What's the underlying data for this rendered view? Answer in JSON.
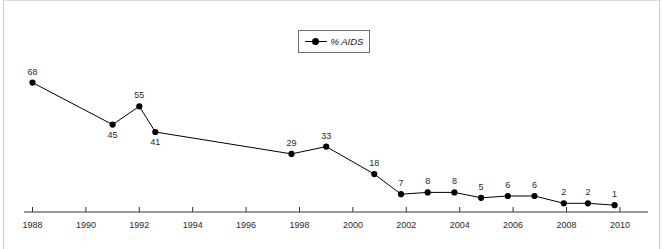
{
  "chart_data": {
    "type": "line",
    "title": "",
    "subtitle": "",
    "xlabel": "",
    "ylabel": "",
    "grid": false,
    "legend_position": "top-center",
    "legend": [
      "% AIDS"
    ],
    "series": [
      {
        "name": "% AIDS",
        "marker": "filled-circle",
        "color": "#000000",
        "x": [
          1988,
          1991,
          1992,
          1992.6,
          1997.7,
          1999,
          2000.8,
          2001.8,
          2002.8,
          2003.8,
          2004.8,
          2005.8,
          2006.8,
          2007.9,
          2008.8,
          2009.8
        ],
        "values": [
          68,
          45,
          55,
          41,
          29,
          33,
          18,
          7,
          8,
          8,
          5,
          6,
          6,
          2,
          2,
          1
        ]
      }
    ],
    "point_labels": [
      "68",
      "45",
      "55",
      "41",
      "29",
      "33",
      "18",
      "7",
      "8",
      "8",
      "5",
      "6",
      "6",
      "2",
      "2",
      "1"
    ],
    "xticks": [
      1988,
      1990,
      1992,
      1994,
      1996,
      1998,
      2000,
      2002,
      2004,
      2006,
      2008,
      2010
    ],
    "xticklabels": [
      "1988",
      "1990",
      "1992",
      "1994",
      "1996",
      "1998",
      "2000",
      "2002",
      "2004",
      "2006",
      "2008",
      "2010"
    ],
    "xlim": [
      1987,
      2010.6
    ],
    "ylim": [
      0,
      80
    ],
    "yticks": [],
    "yticklabels": []
  },
  "legend": {
    "entry_label": "% AIDS"
  },
  "colors": {
    "series": "#000000",
    "axis": "#333333",
    "text": "#2a2a2a",
    "frame": "#c9c9c9",
    "background": "#ffffff"
  }
}
